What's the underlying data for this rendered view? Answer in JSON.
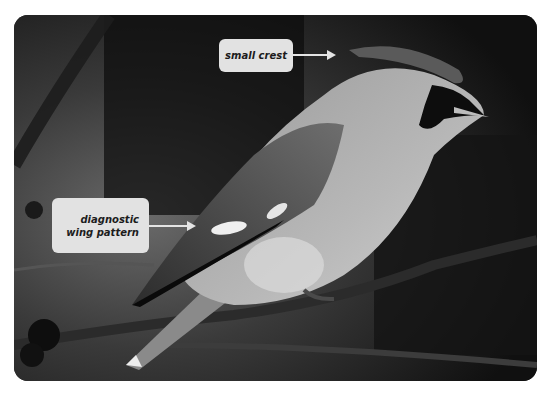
{
  "image": {
    "subject": "waxwing bird perched on a branch",
    "style": "grayscale photograph with annotation callouts"
  },
  "annotations": [
    {
      "label": "small crest",
      "target": "crest"
    },
    {
      "label": "diagnostic wing pattern",
      "target": "wing"
    }
  ],
  "colors": {
    "background": "#ffffff",
    "callout_fill": "#e2e2e2",
    "callout_text": "#1c1c1c",
    "arrow": "#e4e4e4"
  }
}
